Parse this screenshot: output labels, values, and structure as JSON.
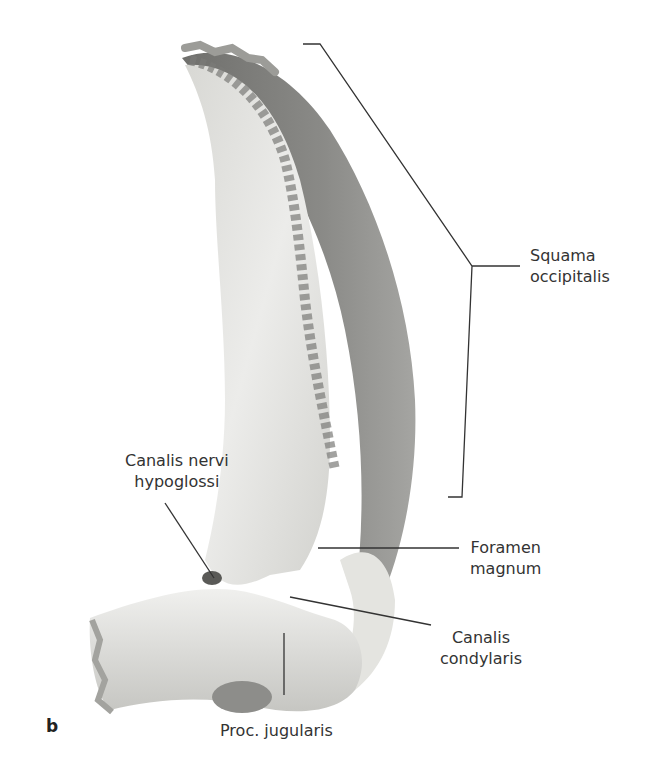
{
  "figure": {
    "panel_letter": "b",
    "colors": {
      "background": "#ffffff",
      "bone_light": "#e9e9e6",
      "bone_mid": "#cfcfcb",
      "bone_dark": "#8f8f8c",
      "outer_surface": "#7d7d7a",
      "leader_line": "#333333"
    }
  },
  "labels": {
    "squama": {
      "line1": "Squama",
      "line2": "occipitalis"
    },
    "hypoglossi": {
      "line1": "Canalis nervi",
      "line2": "hypoglossi"
    },
    "foramen": {
      "line1": "Foramen",
      "line2": "magnum"
    },
    "condylaris": {
      "line1": "Canalis",
      "line2": "condylaris"
    },
    "jugularis": {
      "line1": "Proc. jugularis"
    }
  }
}
